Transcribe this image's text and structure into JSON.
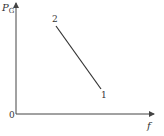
{
  "diagram": {
    "y_axis_label": "P",
    "y_axis_subscript": "G",
    "x_axis_label": "f",
    "origin_label": "0",
    "points": [
      {
        "label": "2",
        "x": 56,
        "y": 26
      },
      {
        "label": "1",
        "x": 101,
        "y": 89
      }
    ],
    "colors": {
      "axis": "#444444",
      "line": "#333333",
      "text": "#333333"
    }
  }
}
